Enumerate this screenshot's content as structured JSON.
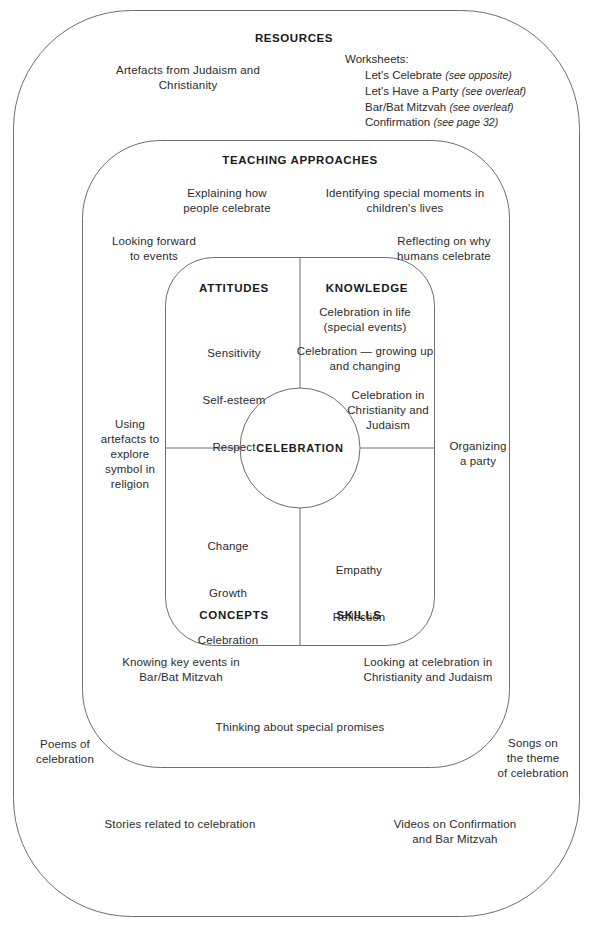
{
  "diagram": {
    "outer": {
      "title": "RESOURCES",
      "items": [
        {
          "id": "artefacts",
          "text": "Artefacts from Judaism and\nChristianity"
        },
        {
          "id": "poems",
          "text": "Poems of\ncelebration"
        },
        {
          "id": "songs",
          "text": "Songs on\nthe theme\nof celebration"
        },
        {
          "id": "stories",
          "text": "Stories related to celebration"
        },
        {
          "id": "videos",
          "text": "Videos on Confirmation\nand Bar Mitzvah"
        }
      ],
      "worksheets": {
        "title": "Worksheets:",
        "entries": [
          {
            "name": "Let's Celebrate",
            "note": "(see opposite)"
          },
          {
            "name": "Let's Have a Party",
            "note": "(see overleaf)"
          },
          {
            "name": "Bar/Bat Mitzvah",
            "note": "(see overleaf)"
          },
          {
            "name": "Confirmation",
            "note": "(see page 32)"
          }
        ]
      }
    },
    "middle": {
      "title": "TEACHING APPROACHES",
      "items": [
        {
          "id": "explaining",
          "text": "Explaining how\npeople celebrate"
        },
        {
          "id": "identifying",
          "text": "Identifying special moments in\nchildren's lives"
        },
        {
          "id": "looking-forward",
          "text": "Looking forward\nto events"
        },
        {
          "id": "reflecting",
          "text": "Reflecting on why\nhumans celebrate"
        },
        {
          "id": "using-artefacts",
          "text": "Using\nartefacts to\nexplore\nsymbol in\nreligion"
        },
        {
          "id": "organizing",
          "text": "Organizing\na party"
        },
        {
          "id": "knowing-key-events",
          "text": "Knowing key events in\nBar/Bat Mitzvah"
        },
        {
          "id": "looking-at-celebration",
          "text": "Looking at celebration in\nChristianity and Judaism"
        },
        {
          "id": "thinking-promises",
          "text": "Thinking about special promises"
        }
      ]
    },
    "core": {
      "center_label": "CELEBRATION",
      "quadrants": [
        {
          "id": "attitudes",
          "heading": "ATTITUDES",
          "items": [
            "Sensitivity",
            "Self-esteem",
            "Respect"
          ]
        },
        {
          "id": "knowledge",
          "heading": "KNOWLEDGE",
          "items": [
            "Celebration in life\n(special events)",
            "Celebration — growing up\nand changing",
            "Celebration in\nChristianity and\nJudaism"
          ]
        },
        {
          "id": "concepts",
          "heading": "CONCEPTS",
          "items": [
            "Change",
            "Growth",
            "Celebration"
          ]
        },
        {
          "id": "skills",
          "heading": "SKILLS",
          "items": [
            "Empathy",
            "Reflection"
          ]
        }
      ]
    },
    "colors": {
      "stroke": "#6e6e6e",
      "text": "#2b2b2b",
      "heading": "#1a1a1a",
      "background": "#ffffff"
    }
  }
}
